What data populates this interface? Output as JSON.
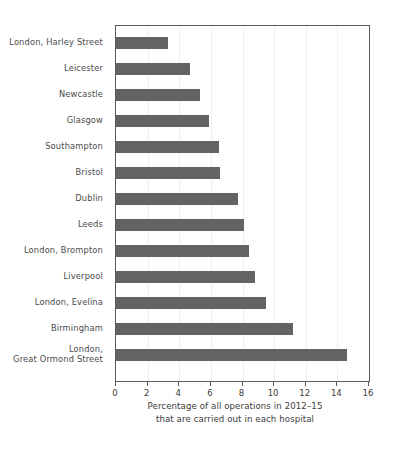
{
  "chart_data": {
    "type": "bar",
    "orientation": "horizontal",
    "title": "",
    "subtitle": "",
    "xlabel": "Percentage of all operations in 2012–15 that are carried out in each hospital",
    "ylabel": "",
    "xlim": [
      0,
      16
    ],
    "xticks": [
      0,
      2,
      4,
      6,
      8,
      10,
      12,
      14,
      16
    ],
    "xtick_labels": [
      "0",
      "2",
      "4",
      "6",
      "8",
      "10",
      "12",
      "14",
      "16"
    ],
    "grid": "vertical-light",
    "legend": "none",
    "bar_color": "#636363",
    "categories": [
      "London, Harley Street",
      "Leicester",
      "Newcastle",
      "Glasgow",
      "Southampton",
      "Bristol",
      "Dublin",
      "Leeds",
      "London, Brompton",
      "Liverpool",
      "London, Evelina",
      "Birmingham",
      "London,\nGreat Ormond Street"
    ],
    "values": [
      3.3,
      4.7,
      5.3,
      5.9,
      6.5,
      6.6,
      7.7,
      8.1,
      8.4,
      8.8,
      9.5,
      11.2,
      14.6
    ]
  },
  "axis": {
    "x_title_line1": "Percentage of all operations in 2012–15",
    "x_title_line2": "that are carried out in each hospital"
  }
}
